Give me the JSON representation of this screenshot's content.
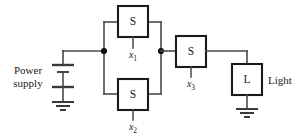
{
  "diagram": {
    "type": "circuit-schematic",
    "width": 302,
    "height": 136,
    "background_color": "#ffffff",
    "wire_color": "#4a4a4a",
    "component_outline_color": "#1a1a1a",
    "text_color": "#1a1a1a"
  },
  "labels": {
    "power_supply_line1": "Power",
    "power_supply_line2": "supply",
    "light": "Light"
  },
  "components": {
    "switch1": {
      "symbol": "S",
      "variable": "x",
      "subscript": "1",
      "kind": "switch",
      "position": "top-parallel-branch"
    },
    "switch2": {
      "symbol": "S",
      "variable": "x",
      "subscript": "2",
      "kind": "switch",
      "position": "bottom-parallel-branch"
    },
    "switch3": {
      "symbol": "S",
      "variable": "x",
      "subscript": "3",
      "kind": "switch",
      "position": "series"
    },
    "lamp": {
      "symbol": "L",
      "kind": "light",
      "position": "right"
    },
    "battery": {
      "kind": "power-supply",
      "position": "left"
    },
    "ground_battery": {
      "kind": "ground",
      "position": "below-battery"
    },
    "ground_lamp": {
      "kind": "ground",
      "position": "below-lamp"
    }
  },
  "nodes": [
    {
      "name": "junction-left",
      "x": 104,
      "y": 51
    },
    {
      "name": "junction-right",
      "x": 161,
      "y": 51
    }
  ]
}
